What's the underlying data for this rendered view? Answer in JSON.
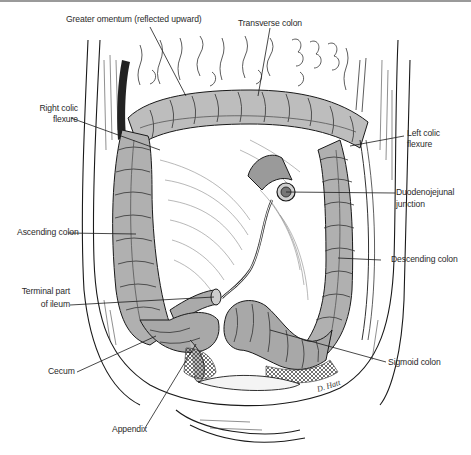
{
  "figure": {
    "labels": {
      "greater_omentum": "Greater omentum (reflected upward)",
      "transverse_colon": "Transverse colon",
      "right_colic_flexure_1": "Right colic",
      "right_colic_flexure_2": "flexure",
      "left_colic_flexure_1": "Left colic",
      "left_colic_flexure_2": "flexure",
      "duodenojejunal_1": "Duodenojejunal",
      "duodenojejunal_2": "junction",
      "ascending_colon": "Ascending colon",
      "descending_colon": "Descending colon",
      "terminal_ileum_1": "Terminal part",
      "terminal_ileum_2": "of ileum",
      "cecum": "Cecum",
      "sigmoid_colon": "Sigmoid colon",
      "appendix": "Appendix"
    },
    "signature": "D. Hatt",
    "colors": {
      "ink": "#1a1a1a",
      "shade": "#8c8c8c",
      "light_shade": "#c4c4c4",
      "label_text": "#2a2a2a",
      "top_border": "#9a9a9a"
    }
  }
}
